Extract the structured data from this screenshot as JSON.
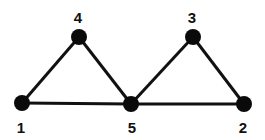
{
  "diagram": {
    "type": "graph",
    "colors": {
      "node": "#0a0a0a",
      "edge": "#111111",
      "label": "#111111",
      "background": "#ffffff"
    },
    "nodes": [
      {
        "id": "1",
        "label": "1",
        "x": 22,
        "y": 103,
        "label_x": 21,
        "label_y": 133
      },
      {
        "id": "2",
        "label": "2",
        "x": 244,
        "y": 104,
        "label_x": 243,
        "label_y": 133
      },
      {
        "id": "3",
        "label": "3",
        "x": 193,
        "y": 37,
        "label_x": 192,
        "label_y": 23
      },
      {
        "id": "4",
        "label": "4",
        "x": 79,
        "y": 37,
        "label_x": 78,
        "label_y": 23
      },
      {
        "id": "5",
        "label": "5",
        "x": 131,
        "y": 104,
        "label_x": 132,
        "label_y": 133
      }
    ],
    "edges": [
      {
        "from": "1",
        "to": "4"
      },
      {
        "from": "4",
        "to": "5"
      },
      {
        "from": "1",
        "to": "5"
      },
      {
        "from": "5",
        "to": "3"
      },
      {
        "from": "3",
        "to": "2"
      },
      {
        "from": "5",
        "to": "2"
      }
    ]
  }
}
